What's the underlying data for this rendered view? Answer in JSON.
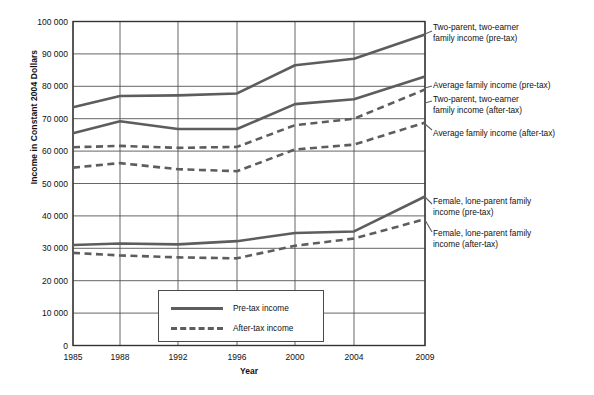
{
  "chart_data": {
    "type": "line",
    "title": "",
    "xlabel": "Year",
    "ylabel": "Income in Constant 2004 Dollars",
    "categories": [
      "1985",
      "1988",
      "1992",
      "1996",
      "2000",
      "2004",
      "2009"
    ],
    "x_positions": [
      73,
      120,
      178,
      237,
      295,
      354,
      425
    ],
    "ylim": [
      0,
      100000
    ],
    "yticks": [
      "0",
      "10 000",
      "20 000",
      "30 000",
      "40 000",
      "50 000",
      "60 000",
      "70 000",
      "80 000",
      "90 000",
      "100 000"
    ],
    "ytick_values": [
      0,
      10000,
      20000,
      30000,
      40000,
      50000,
      60000,
      70000,
      80000,
      90000,
      100000
    ],
    "grid": true,
    "legend_position": "inside-bottom-center",
    "line_color": "#5d5d5d",
    "grid_color": "#555555",
    "series": [
      {
        "name": "Two-parent, two-earner family income (pre-tax)",
        "style": "solid",
        "values": [
          73500,
          77000,
          77200,
          77800,
          86500,
          88500,
          96000
        ],
        "label_text": "Two-parent, two-earner\nfamily income (pre-tax)",
        "label_x": 433,
        "label_y": 22,
        "leader_from": [
          425,
          34
        ],
        "leader_to": [
          432,
          31
        ]
      },
      {
        "name": "Average family income (pre-tax)",
        "style": "solid",
        "values": [
          65500,
          69200,
          66800,
          66800,
          74500,
          76000,
          83000
        ],
        "label_text": "Average family income (pre-tax)",
        "label_x": 433,
        "label_y": 80,
        "leader_from": [
          425,
          88
        ],
        "leader_to": [
          432,
          86
        ]
      },
      {
        "name": "Two-parent, two-earner family income (after-tax)",
        "style": "dashed",
        "values": [
          61200,
          61600,
          61000,
          61300,
          68000,
          70000,
          79000
        ],
        "label_text": "Two-parent, two-earner\nfamily income (after-tax)",
        "label_x": 433,
        "label_y": 94,
        "leader_from": [
          425,
          103
        ],
        "leader_to": [
          432,
          101
        ]
      },
      {
        "name": "Average family income (after-tax)",
        "style": "dashed",
        "values": [
          54900,
          56300,
          54400,
          53800,
          60500,
          62000,
          68800
        ],
        "label_text": "Average family income (after-tax)",
        "label_x": 433,
        "label_y": 128,
        "leader_from": [
          425,
          124
        ],
        "leader_to": [
          432,
          130
        ]
      },
      {
        "name": "Female, lone-parent family income (pre-tax)",
        "style": "solid",
        "values": [
          31000,
          31500,
          31200,
          32200,
          34700,
          35200,
          46000
        ],
        "label_text": "Female, lone-parent family\nincome (pre-tax)",
        "label_x": 433,
        "label_y": 196,
        "leader_from": [
          425,
          197
        ],
        "leader_to": [
          432,
          204
        ]
      },
      {
        "name": "Female, lone-parent family income (after-tax)",
        "style": "dashed",
        "values": [
          28600,
          27800,
          27200,
          26900,
          30800,
          33000,
          39000
        ],
        "label_text": "Female, lone-parent family\nincome (after-tax)",
        "label_x": 433,
        "label_y": 228,
        "leader_from": [
          425,
          220
        ],
        "leader_to": [
          432,
          232
        ]
      }
    ],
    "legend": {
      "entries": [
        {
          "label": "Pre-tax income",
          "style": "solid"
        },
        {
          "label": "After-tax income",
          "style": "dashed"
        }
      ]
    }
  }
}
